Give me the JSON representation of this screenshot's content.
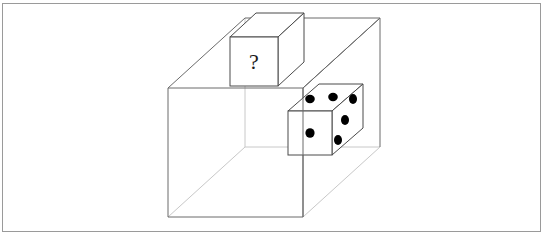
{
  "figure": {
    "frame": {
      "x": 2.5,
      "y": 3.5,
      "width": 538,
      "height": 228,
      "stroke": "#9a9a9a",
      "stroke_width": 1,
      "fill": "#ffffff"
    },
    "outer_box": {
      "name": "large-transparent-box",
      "stroke_visible": "#6b6b6b",
      "stroke_hidden": "#c4c4c4",
      "stroke_width": 1,
      "fill": "none",
      "front_face": {
        "left": 168,
        "right": 303,
        "top": 88,
        "bottom": 217
      },
      "depth_dx": 77,
      "depth_dy": -70
    },
    "question_cube": {
      "name": "question-cube",
      "label": "?",
      "label_color": "#1a1a1a",
      "label_font_size": 22,
      "stroke": "#4a4a4a",
      "stroke_width": 1,
      "fill": "#ffffff",
      "front_face": {
        "left": 230,
        "right": 278,
        "top": 37,
        "bottom": 86
      },
      "depth_dx": 26,
      "depth_dy": -24
    },
    "die": {
      "name": "die",
      "stroke": "#4a4a4a",
      "stroke_width": 1,
      "fill": "#ffffff",
      "pip_color": "#000000",
      "front_face": {
        "left": 288,
        "right": 332,
        "top": 111,
        "bottom": 155
      },
      "depth_dx": 31,
      "depth_dy": -27,
      "faces": {
        "front_value": 1,
        "top_value": 2,
        "right_value": 3
      },
      "pips": {
        "front": [
          {
            "u": 0.5,
            "v": 0.5
          }
        ],
        "top": [
          {
            "u": 0.28,
            "v": 0.3
          },
          {
            "u": 0.66,
            "v": 0.32
          }
        ],
        "right": [
          {
            "u": 0.24,
            "v": 0.2
          },
          {
            "u": 0.5,
            "v": 0.5
          },
          {
            "u": 0.78,
            "v": 0.78
          }
        ]
      },
      "pip_radius_front": 4.6,
      "pip_radius_top": 4.4,
      "pip_radius_right": 4.2
    },
    "caption_fragments": {
      "fragment_one": "",
      "fragment_two": ""
    }
  }
}
